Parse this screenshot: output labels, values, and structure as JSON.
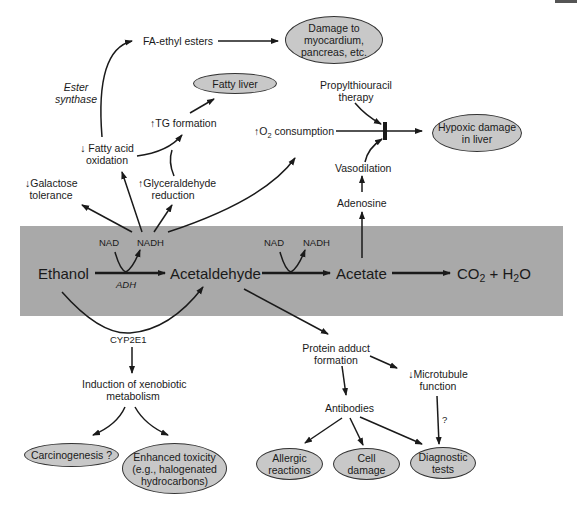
{
  "diagram": {
    "main_pathway": {
      "ethanol": "Ethanol",
      "acetaldehyde": "Acetaldehyde",
      "acetate": "Acetate",
      "products": {
        "co2_prefix": "CO",
        "co2_sub": "2",
        "plus": "+",
        "h2o_prefix": "H",
        "h2o_sub": "2",
        "h2o_suffix": "O"
      },
      "step1": {
        "cofactor_in": "NAD",
        "cofactor_out": "NADH",
        "enzyme": "ADH"
      },
      "step2": {
        "cofactor_in": "NAD",
        "cofactor_out": "NADH"
      },
      "band_color": "#a9a9a9"
    },
    "upper_left": {
      "fa_ethyl_esters": "FA-ethyl esters",
      "ester_synthase_line1": "Ester",
      "ester_synthase_line2": "synthase",
      "fatty_acid_ox_line1": "↓ Fatty acid",
      "fatty_acid_ox_line2": "oxidation",
      "tg_formation": "↑TG formation",
      "glyceraldehyde_line1": "↑Glyceraldehyde",
      "glyceraldehyde_line2": "reduction",
      "galactose_line1": "↓Galactose",
      "galactose_line2": "tolerance",
      "o2_prefix": "↑O",
      "o2_sub": "2",
      "o2_suffix": " consumption"
    },
    "upper_right": {
      "propylthiouracil_line1": "Propylthiouracil",
      "propylthiouracil_line2": "therapy",
      "vasodilation": "Vasodilation",
      "adenosine": "Adenosine"
    },
    "outcomes_top": {
      "damage_myocardium": "Damage to\nmyocardium,\npancreas, etc.",
      "fatty_liver": "Fatty liver",
      "hypoxic_damage": "Hypoxic damage\nin liver"
    },
    "lower_left": {
      "cyp2e1": "CYP2E1",
      "induction_line1": "Induction of xenobiotic",
      "induction_line2": "metabolism",
      "carcinogenesis": "Carcinogenesis ?",
      "enhanced_toxicity": "Enhanced toxicity\n(e.g., halogenated\nhydrocarbons)"
    },
    "lower_right": {
      "protein_adduct_line1": "Protein adduct",
      "protein_adduct_line2": "formation",
      "microtubule_line1": "↓Microtubule",
      "microtubule_line2": "function",
      "question_mark": "?",
      "antibodies": "Antibodies",
      "allergic_reactions": "Allergic\nreactions",
      "cell_damage": "Cell\ndamage",
      "diagnostic_tests": "Diagnostic\ntests"
    },
    "colors": {
      "ellipse_fill": "#c8c8c8",
      "line": "#1a1a1a"
    }
  }
}
